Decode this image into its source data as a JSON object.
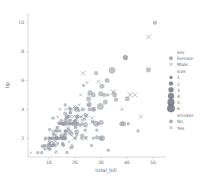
{
  "chart_data": {
    "type": "scatter",
    "title": "",
    "xlabel": "total_bill",
    "ylabel": "tip",
    "xlim": [
      2.0,
      53.5
    ],
    "ylim": [
      0.7,
      10.6
    ],
    "xticks": [
      10,
      20,
      30,
      40,
      50
    ],
    "xticklabels": [
      "10",
      "20",
      "30",
      "40",
      "50"
    ],
    "yticks": [
      2,
      4,
      6,
      8,
      10
    ],
    "yticklabels": [
      "2",
      "4",
      "6",
      "8",
      "10"
    ],
    "grid": false,
    "legend_position": "right-outside",
    "marker_color_female": "#9aa2ad",
    "marker_color_male": "#8e96a2",
    "legends": [
      {
        "title": "sex",
        "entries": [
          {
            "label": "Female",
            "marker": "circle",
            "color": "#9aa2ad"
          },
          {
            "label": "Male",
            "marker": "x",
            "color": "#9aa2ad"
          }
        ]
      },
      {
        "title": "size",
        "entries": [
          {
            "label": "1",
            "marker": "circle",
            "color": "#6f7680",
            "radius": 1.5
          },
          {
            "label": "2",
            "marker": "circle",
            "color": "#6f7680",
            "radius": 2.0
          },
          {
            "label": "3",
            "marker": "circle",
            "color": "#6f7680",
            "radius": 2.5
          },
          {
            "label": "4",
            "marker": "circle",
            "color": "#6f7680",
            "radius": 3.0
          },
          {
            "label": "5",
            "marker": "circle",
            "color": "#6f7680",
            "radius": 3.4
          },
          {
            "label": "6",
            "marker": "circle",
            "color": "#6f7680",
            "radius": 3.8
          }
        ]
      },
      {
        "title": "smoker",
        "entries": [
          {
            "label": "No",
            "marker": "circle",
            "color": "#9aa2ad"
          },
          {
            "label": "Yes",
            "marker": "x",
            "color": "#9aa2ad"
          }
        ]
      }
    ],
    "series": [
      {
        "name": "Female",
        "marker": "circle",
        "points": [
          [
            16.99,
            1.01,
            2
          ],
          [
            10.34,
            1.66,
            3
          ],
          [
            21.01,
            3.5,
            3
          ],
          [
            23.68,
            3.31,
            2
          ],
          [
            24.59,
            3.61,
            4
          ],
          [
            25.29,
            4.71,
            4
          ],
          [
            8.77,
            2.0,
            2
          ],
          [
            26.88,
            3.12,
            4
          ],
          [
            15.04,
            1.96,
            2
          ],
          [
            14.78,
            3.23,
            2
          ],
          [
            10.27,
            1.71,
            2
          ],
          [
            35.26,
            5.0,
            4
          ],
          [
            15.42,
            1.57,
            2
          ],
          [
            18.43,
            3.0,
            4
          ],
          [
            14.83,
            3.02,
            2
          ],
          [
            21.58,
            3.92,
            2
          ],
          [
            10.33,
            1.67,
            3
          ],
          [
            16.29,
            3.71,
            3
          ],
          [
            16.97,
            3.5,
            3
          ],
          [
            20.65,
            3.35,
            3
          ],
          [
            17.92,
            4.08,
            2
          ],
          [
            20.29,
            2.75,
            2
          ],
          [
            15.77,
            2.23,
            2
          ],
          [
            39.42,
            7.58,
            4
          ],
          [
            19.82,
            3.18,
            2
          ],
          [
            17.81,
            2.34,
            4
          ],
          [
            13.37,
            2.0,
            2
          ],
          [
            12.69,
            2.0,
            2
          ],
          [
            21.7,
            4.3,
            2
          ],
          [
            19.65,
            3.0,
            2
          ],
          [
            9.55,
            1.45,
            2
          ],
          [
            18.35,
            2.5,
            4
          ],
          [
            15.06,
            3.0,
            2
          ],
          [
            20.69,
            2.45,
            4
          ],
          [
            17.78,
            3.27,
            2
          ],
          [
            24.06,
            3.6,
            3
          ],
          [
            16.31,
            2.0,
            3
          ],
          [
            16.93,
            3.07,
            3
          ],
          [
            18.69,
            2.31,
            3
          ],
          [
            31.27,
            5.0,
            3
          ],
          [
            16.04,
            2.24,
            3
          ],
          [
            17.46,
            2.54,
            2
          ],
          [
            13.94,
            3.06,
            2
          ],
          [
            9.68,
            1.32,
            2
          ],
          [
            30.4,
            5.6,
            4
          ],
          [
            18.29,
            3.0,
            2
          ],
          [
            22.23,
            5.0,
            2
          ],
          [
            32.4,
            6.0,
            4
          ],
          [
            28.55,
            2.05,
            3
          ],
          [
            18.04,
            3.0,
            2
          ],
          [
            12.54,
            2.5,
            2
          ],
          [
            10.29,
            2.6,
            2
          ],
          [
            34.81,
            5.2,
            4
          ],
          [
            9.94,
            1.56,
            2
          ],
          [
            25.56,
            4.34,
            4
          ],
          [
            19.49,
            3.51,
            2
          ],
          [
            38.01,
            3.0,
            4
          ],
          [
            26.41,
            1.5,
            2
          ],
          [
            11.24,
            1.76,
            2
          ],
          [
            48.27,
            6.73,
            4
          ],
          [
            20.29,
            3.21,
            2
          ],
          [
            13.81,
            2.0,
            2
          ],
          [
            11.02,
            1.98,
            2
          ],
          [
            18.29,
            3.76,
            2
          ],
          [
            17.59,
            2.64,
            3
          ],
          [
            20.08,
            3.15,
            3
          ],
          [
            16.45,
            2.47,
            2
          ],
          [
            3.07,
            1.0,
            1
          ],
          [
            20.23,
            2.01,
            2
          ],
          [
            15.01,
            2.09,
            2
          ],
          [
            12.02,
            1.97,
            2
          ],
          [
            17.07,
            3.0,
            3
          ],
          [
            26.86,
            3.14,
            2
          ],
          [
            25.28,
            5.0,
            2
          ],
          [
            14.73,
            2.2,
            2
          ],
          [
            10.51,
            1.25,
            2
          ],
          [
            17.92,
            3.08,
            2
          ],
          [
            27.2,
            4.0,
            4
          ],
          [
            22.76,
            3.0,
            2
          ],
          [
            17.29,
            2.71,
            2
          ],
          [
            19.44,
            3.0,
            2
          ],
          [
            16.66,
            3.4,
            2
          ],
          [
            10.07,
            1.83,
            1
          ],
          [
            32.68,
            5.0,
            2
          ],
          [
            15.98,
            2.03,
            2
          ],
          [
            34.83,
            5.17,
            4
          ],
          [
            13.03,
            2.0,
            2
          ],
          [
            18.28,
            4.0,
            2
          ],
          [
            24.71,
            5.85,
            2
          ],
          [
            21.16,
            3.0,
            2
          ],
          [
            28.97,
            3.0,
            2
          ],
          [
            22.49,
            3.5,
            2
          ],
          [
            5.75,
            1.0,
            2
          ],
          [
            16.32,
            4.3,
            2
          ],
          [
            22.75,
            3.25,
            2
          ],
          [
            40.17,
            4.73,
            4
          ],
          [
            27.28,
            4.0,
            2
          ],
          [
            12.03,
            1.5,
            2
          ],
          [
            21.01,
            3.0,
            2
          ],
          [
            12.46,
            1.5,
            2
          ],
          [
            11.35,
            2.5,
            2
          ],
          [
            15.38,
            3.0,
            2
          ],
          [
            44.3,
            2.5,
            2
          ],
          [
            22.42,
            3.48,
            2
          ],
          [
            20.92,
            4.08,
            2
          ],
          [
            15.36,
            1.64,
            2
          ],
          [
            20.49,
            4.06,
            2
          ],
          [
            25.21,
            4.29,
            2
          ],
          [
            18.24,
            3.76,
            2
          ],
          [
            14.31,
            4.0,
            2
          ],
          [
            14.0,
            3.0,
            2
          ],
          [
            7.25,
            1.0,
            2
          ],
          [
            38.07,
            4.0,
            3
          ],
          [
            23.95,
            2.55,
            2
          ],
          [
            25.71,
            4.0,
            3
          ],
          [
            17.31,
            3.5,
            2
          ],
          [
            29.93,
            5.07,
            4
          ],
          [
            10.65,
            1.5,
            2
          ],
          [
            12.43,
            1.8,
            2
          ],
          [
            24.08,
            2.92,
            4
          ],
          [
            11.69,
            2.31,
            2
          ],
          [
            13.42,
            1.68,
            2
          ],
          [
            14.26,
            2.5,
            2
          ],
          [
            15.95,
            2.0,
            2
          ],
          [
            12.48,
            2.52,
            2
          ],
          [
            29.8,
            4.2,
            6
          ],
          [
            8.52,
            1.48,
            2
          ],
          [
            14.52,
            2.0,
            2
          ],
          [
            11.38,
            2.0,
            2
          ],
          [
            22.82,
            2.18,
            3
          ],
          [
            19.08,
            1.5,
            2
          ],
          [
            20.27,
            2.83,
            2
          ],
          [
            11.17,
            1.5,
            2
          ],
          [
            12.26,
            2.0,
            2
          ],
          [
            18.26,
            3.25,
            2
          ],
          [
            8.51,
            1.25,
            2
          ],
          [
            10.33,
            2.0,
            2
          ],
          [
            14.15,
            2.0,
            2
          ],
          [
            16.0,
            2.0,
            3
          ],
          [
            13.16,
            2.75,
            2
          ],
          [
            17.47,
            3.5,
            2
          ],
          [
            34.3,
            6.7,
            6
          ],
          [
            41.19,
            5.0,
            5
          ],
          [
            27.05,
            5.0,
            4
          ],
          [
            16.43,
            2.3,
            2
          ],
          [
            8.35,
            1.5,
            2
          ],
          [
            18.64,
            1.36,
            3
          ],
          [
            11.87,
            1.63,
            2
          ],
          [
            19.81,
            4.19,
            2
          ],
          [
            28.44,
            2.56,
            2
          ],
          [
            15.48,
            2.02,
            2
          ],
          [
            16.58,
            4.0,
            2
          ],
          [
            7.56,
            1.44,
            2
          ],
          [
            10.34,
            2.0,
            2
          ],
          [
            43.11,
            5.0,
            4
          ],
          [
            13.0,
            2.0,
            2
          ],
          [
            13.51,
            2.0,
            2
          ],
          [
            18.71,
            4.0,
            3
          ],
          [
            12.74,
            2.01,
            2
          ],
          [
            13.0,
            2.0,
            2
          ],
          [
            16.4,
            2.5,
            2
          ],
          [
            20.53,
            4.0,
            4
          ],
          [
            16.47,
            3.23,
            3
          ],
          [
            26.59,
            3.41,
            3
          ],
          [
            38.73,
            3.0,
            4
          ],
          [
            24.27,
            2.03,
            2
          ],
          [
            12.76,
            2.23,
            2
          ],
          [
            30.06,
            2.0,
            3
          ],
          [
            25.89,
            5.16,
            4
          ],
          [
            48.33,
            9.0,
            4
          ],
          [
            13.27,
            2.5,
            2
          ],
          [
            28.17,
            6.5,
            3
          ],
          [
            12.9,
            1.1,
            2
          ],
          [
            28.15,
            3.0,
            5
          ],
          [
            11.59,
            1.5,
            2
          ],
          [
            7.74,
            1.44,
            2
          ],
          [
            30.14,
            3.09,
            4
          ],
          [
            12.16,
            2.2,
            2
          ],
          [
            13.42,
            3.48,
            2
          ],
          [
            8.58,
            1.92,
            1
          ],
          [
            15.98,
            3.0,
            3
          ],
          [
            13.42,
            1.58,
            2
          ],
          [
            16.27,
            2.5,
            2
          ],
          [
            10.09,
            2.0,
            2
          ],
          [
            20.45,
            3.0,
            4
          ],
          [
            13.28,
            2.72,
            2
          ],
          [
            22.12,
            2.88,
            2
          ],
          [
            24.01,
            2.0,
            4
          ],
          [
            15.69,
            3.0,
            3
          ],
          [
            11.61,
            3.39,
            2
          ],
          [
            10.77,
            1.47,
            2
          ],
          [
            15.53,
            3.0,
            2
          ],
          [
            10.07,
            1.25,
            2
          ],
          [
            12.6,
            1.0,
            2
          ],
          [
            32.83,
            1.17,
            2
          ],
          [
            35.83,
            4.67,
            3
          ],
          [
            29.03,
            5.92,
            3
          ],
          [
            27.18,
            2.0,
            2
          ],
          [
            22.67,
            2.0,
            2
          ],
          [
            17.82,
            1.75,
            2
          ],
          [
            18.78,
            3.0,
            2
          ],
          [
            50.81,
            10.0,
            3
          ],
          [
            45.35,
            3.5,
            3
          ],
          [
            40.55,
            3.0,
            2
          ],
          [
            31.71,
            4.5,
            4
          ],
          [
            23.17,
            6.5,
            4
          ],
          [
            23.33,
            5.65,
            2
          ],
          [
            20.76,
            2.24,
            2
          ],
          [
            24.52,
            3.48,
            3
          ],
          [
            20.9,
            3.5,
            3
          ],
          [
            30.46,
            2.0,
            5
          ],
          [
            18.15,
            3.5,
            3
          ],
          [
            23.1,
            4.0,
            3
          ],
          [
            15.69,
            1.5,
            2
          ],
          [
            19.77,
            2.0,
            4
          ],
          [
            39.42,
            7.58,
            4
          ]
        ]
      }
    ]
  }
}
